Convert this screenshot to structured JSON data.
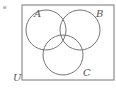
{
  "diagram": {
    "type": "venn",
    "marker": "e",
    "universe_label": "U",
    "sets": [
      {
        "label": "A",
        "cx": 46,
        "cy": 30,
        "r": 20,
        "label_x": 34,
        "label_y": 17
      },
      {
        "label": "B",
        "cx": 80,
        "cy": 30,
        "r": 20,
        "label_x": 96,
        "label_y": 17
      },
      {
        "label": "C",
        "cx": 63,
        "cy": 55,
        "r": 20,
        "label_x": 83,
        "label_y": 76
      }
    ],
    "universe": {
      "x": 22,
      "y": 5,
      "w": 92,
      "h": 75,
      "label_x": 13,
      "label_y": 81
    },
    "shaded_region": "A∩B∩C",
    "colors": {
      "stroke": "#777777",
      "shade": "#eeeeee",
      "label": "#555555"
    }
  }
}
